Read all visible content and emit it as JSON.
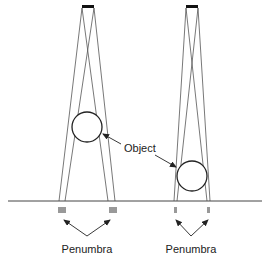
{
  "diagram": {
    "type": "penumbra-geometry",
    "labels": {
      "object": "Object",
      "penumbra_left": "Penumbra",
      "penumbra_right": "Penumbra"
    },
    "colors": {
      "line": "#333333",
      "ray": "#555555",
      "source": "#111111",
      "penumbra": "#888888",
      "background": "#ffffff"
    },
    "left_setup": {
      "source": {
        "x1": 82,
        "x2": 94,
        "y": 6
      },
      "object": {
        "cx": 87,
        "cy": 127,
        "r": 15
      },
      "shadow_edges": [
        59,
        65,
        108,
        115
      ]
    },
    "right_setup": {
      "source": {
        "x1": 186,
        "x2": 198,
        "y": 6
      },
      "object": {
        "cx": 192,
        "cy": 176,
        "r": 15
      },
      "shadow_edges": [
        174,
        177,
        207,
        210
      ]
    },
    "ground_y": 201
  }
}
